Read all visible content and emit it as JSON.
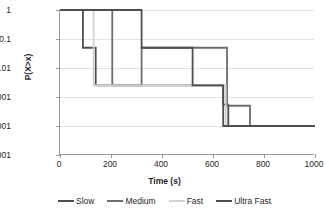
{
  "chart_data": {
    "type": "line",
    "title": "",
    "xlabel": "Time (s)",
    "ylabel": "P(X>x)",
    "xlim": [
      0,
      1000
    ],
    "ylim": [
      1e-05,
      1
    ],
    "yscale": "log",
    "grid": true,
    "legend_position": "bottom",
    "xticks": [
      "0",
      "200",
      "400",
      "600",
      "800",
      "1000"
    ],
    "xtick_values": [
      0,
      200,
      400,
      600,
      800,
      1000
    ],
    "yticks": [
      "1",
      "0.1",
      "0.01",
      "0.001",
      "0.0001",
      "0.00001"
    ],
    "ytick_values": [
      1,
      0.1,
      0.01,
      0.001,
      0.0001,
      1e-05
    ],
    "series": [
      {
        "name": "Slow",
        "color": "#4f4f4f",
        "steps_x": [
          0,
          90,
          90,
          140,
          140,
          640,
          640,
          660,
          660,
          1000
        ],
        "steps_y": [
          1,
          1,
          0.05,
          0.05,
          0.0025,
          0.0025,
          0.00055,
          0.00055,
          0.0001,
          0.0001
        ]
      },
      {
        "name": "Medium",
        "color": "#6e6e6e",
        "steps_x": [
          0,
          205,
          205,
          320,
          320,
          655,
          655,
          745,
          745,
          1000
        ],
        "steps_y": [
          1,
          1,
          0.0025,
          0.0025,
          0.05,
          0.05,
          0.0005,
          0.0005,
          0.0001,
          0.0001
        ]
      },
      {
        "name": "Fast",
        "color": "#d2d2d2",
        "steps_x": [
          0,
          132,
          132,
          650,
          650,
          1000
        ],
        "steps_y": [
          1,
          1,
          0.0025,
          0.0025,
          0.0001,
          0.0001
        ]
      },
      {
        "name": "Ultra Fast",
        "color": "#4f4f4f",
        "steps_x": [
          0,
          320,
          320,
          520,
          520,
          640,
          640,
          1000
        ],
        "steps_y": [
          1,
          1,
          0.05,
          0.05,
          0.0025,
          0.0025,
          0.0001,
          0.0001
        ]
      }
    ]
  }
}
